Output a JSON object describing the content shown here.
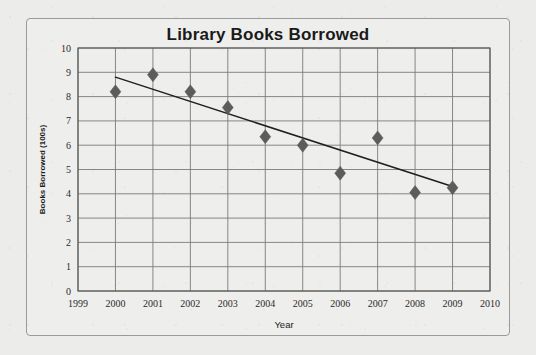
{
  "figure": {
    "title": "Library Books Borrowed",
    "background_color": "#ececea",
    "frame_color": "#9a9a9a",
    "plot_background": "#eeeeec"
  },
  "chart_data": {
    "type": "scatter",
    "title": "Library Books Borrowed",
    "xlabel": "Year",
    "ylabel": "Books Borrowed (100s)",
    "xlim": [
      1999,
      2010
    ],
    "ylim": [
      0,
      10
    ],
    "grid": true,
    "legend": null,
    "xticks": [
      1999,
      2000,
      2001,
      2002,
      2003,
      2004,
      2005,
      2006,
      2007,
      2008,
      2009,
      2010
    ],
    "xtick_labels": [
      "1999",
      "2000",
      "2001",
      "2002",
      "2003",
      "2004",
      "2005",
      "2006",
      "2007",
      "2008",
      "2009",
      "2010"
    ],
    "yticks": [
      0,
      1,
      2,
      3,
      4,
      5,
      6,
      7,
      8,
      9,
      10
    ],
    "ytick_labels": [
      "0",
      "1",
      "2",
      "3",
      "4",
      "5",
      "6",
      "7",
      "8",
      "9",
      "10"
    ],
    "x": [
      2000,
      2001,
      2002,
      2003,
      2004,
      2005,
      2006,
      2007,
      2008,
      2009
    ],
    "y": [
      8.2,
      8.9,
      8.2,
      7.55,
      6.35,
      6.0,
      4.85,
      6.3,
      4.05,
      4.25
    ],
    "marker": "diamond",
    "marker_color": "#5c5c5c",
    "marker_size": 7,
    "series": [
      {
        "name": "Books Borrowed",
        "points": [
          {
            "year": 2000,
            "value": 8.2
          },
          {
            "year": 2001,
            "value": 8.9
          },
          {
            "year": 2002,
            "value": 8.2
          },
          {
            "year": 2003,
            "value": 7.55
          },
          {
            "year": 2004,
            "value": 6.35
          },
          {
            "year": 2005,
            "value": 6.0
          },
          {
            "year": 2006,
            "value": 4.85
          },
          {
            "year": 2007,
            "value": 6.3
          },
          {
            "year": 2008,
            "value": 4.05
          },
          {
            "year": 2009,
            "value": 4.25
          }
        ]
      }
    ],
    "trendline": {
      "type": "line",
      "color": "#1f1f1f",
      "x_start": 2000,
      "y_start": 8.8,
      "x_end": 2009,
      "y_end": 4.3
    }
  }
}
